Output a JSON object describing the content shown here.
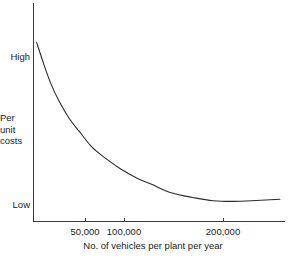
{
  "chart_data": {
    "type": "line",
    "title": "",
    "subtitle": "",
    "xlabel": "No. of vehicles per plant per year",
    "ylabel": "Per unit costs",
    "xtick_labels": [
      "50,000",
      "100,000",
      "200,000"
    ],
    "xtick_values": [
      50000,
      100000,
      200000
    ],
    "ytick_labels": [
      "High",
      "Low"
    ],
    "xlim": [
      15000,
      260000
    ],
    "ylim": [
      0,
      100
    ],
    "grid": false,
    "legend": null,
    "annotations": [],
    "series": [
      {
        "name": "Per unit costs",
        "color": "#2b2b2b",
        "x": [
          18000,
          25000,
          32000,
          40000,
          50000,
          60000,
          72000,
          85000,
          100000,
          115000,
          130000,
          150000,
          170000,
          190000,
          210000,
          232000,
          255000
        ],
        "y": [
          82,
          72,
          63,
          55,
          47,
          41,
          34,
          29,
          24,
          20,
          17,
          13,
          11,
          9.5,
          9.2,
          9.6,
          10.2
        ]
      }
    ]
  },
  "axes": {
    "y_top_label": "High",
    "y_bottom_label": "Low",
    "y_axis_title_lines": [
      "Per",
      "unit",
      "costs"
    ],
    "x_axis_title": "No. of vehicles per plant per year",
    "x_ticks": [
      {
        "label": "50,000"
      },
      {
        "label": "100,000"
      },
      {
        "label": "200,000"
      }
    ]
  },
  "style": {
    "axis_color": "#3a3a3a",
    "curve_color": "#2b2b2b",
    "background": "#ffffff",
    "text_color": "#1a1a1a"
  }
}
